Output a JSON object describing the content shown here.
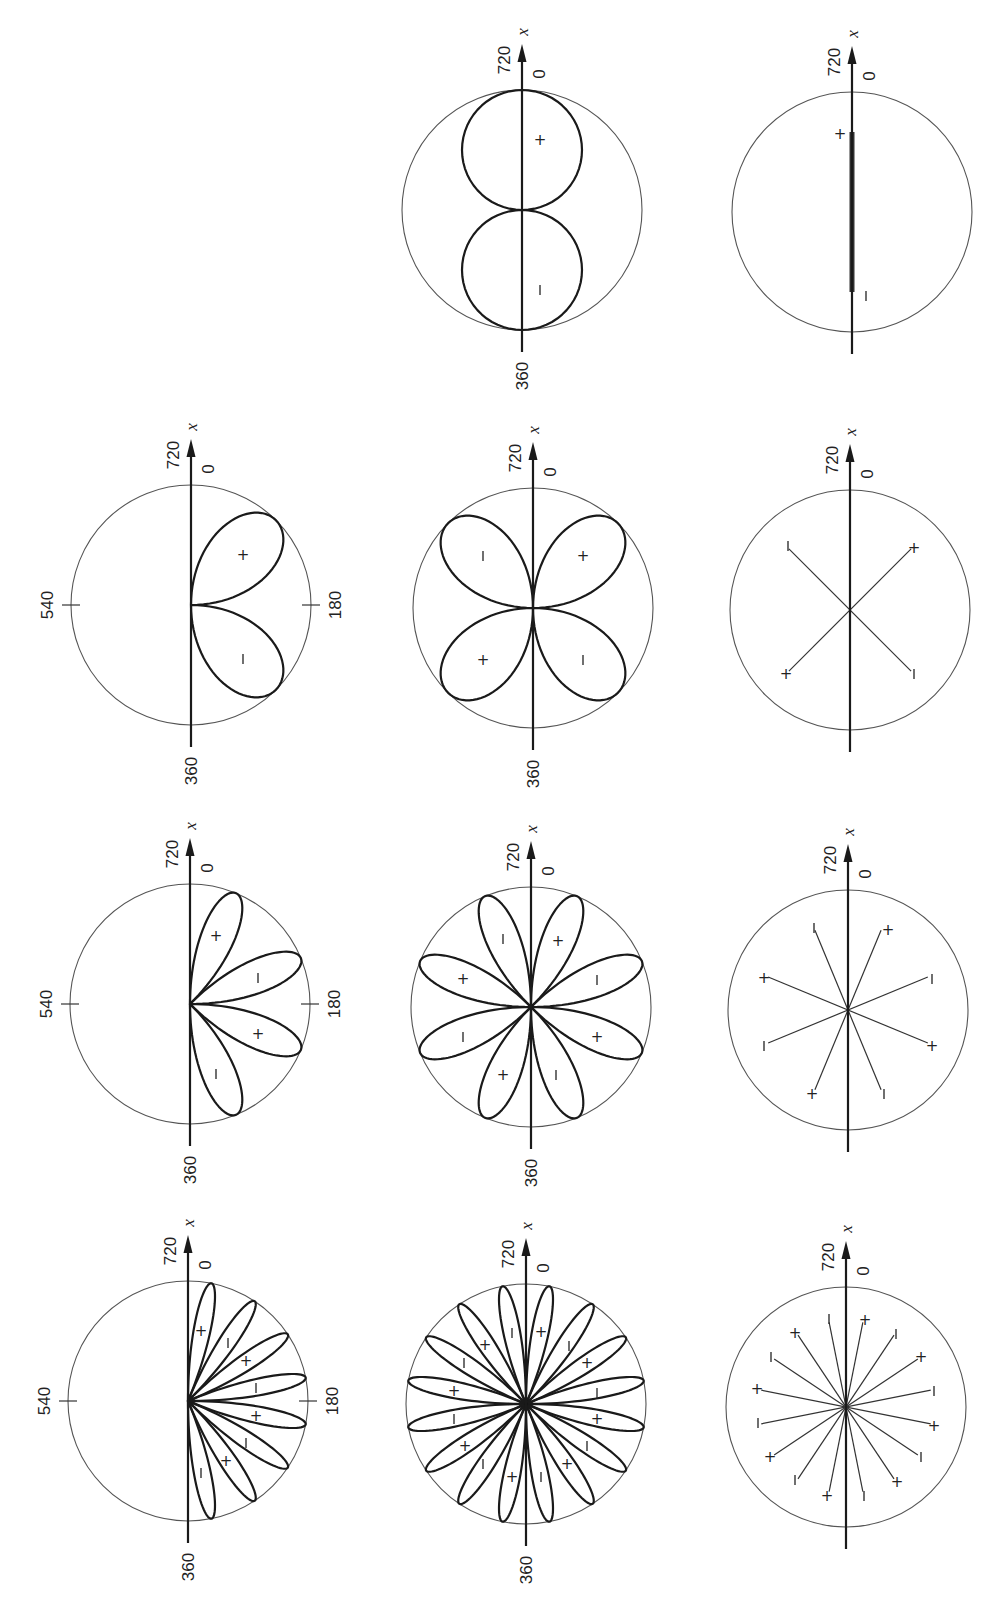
{
  "figure": {
    "colors": {
      "ink": "#1a1a1a",
      "circle": "#555555",
      "background": "#ffffff"
    },
    "axis_labels": {
      "variable": "x",
      "top_left": "720",
      "top_right": "0",
      "bottom": "360",
      "left_tick": "540",
      "right_tick": "180"
    },
    "radius": 120
  },
  "panels": [
    {
      "id": "r1-middle",
      "row": 1,
      "col": "middle",
      "cx": 522,
      "cy": 210,
      "kind": "rosette",
      "n": 1,
      "half": false,
      "show360": true,
      "showTicks": false,
      "signs": [
        {
          "dx": 18,
          "dy": -70,
          "s": "+"
        },
        {
          "dx": 18,
          "dy": 80,
          "s": "−"
        }
      ]
    },
    {
      "id": "r1-right",
      "row": 1,
      "col": "right",
      "cx": 852,
      "cy": 212,
      "kind": "segment",
      "show360": false,
      "showTicks": false,
      "segment": {
        "y1": -80,
        "y2": 80
      },
      "signs": [
        {
          "dx": -12,
          "dy": -78,
          "s": "+"
        },
        {
          "dx": 14,
          "dy": 84,
          "s": "−"
        }
      ]
    },
    {
      "id": "r2-left",
      "row": 2,
      "col": "left",
      "cx": 191,
      "cy": 605,
      "kind": "rosette",
      "n": 2,
      "half": true,
      "show360": true,
      "showTicks": true,
      "signs": [
        {
          "dx": 52,
          "dy": -50,
          "s": "+"
        },
        {
          "dx": 52,
          "dy": 54,
          "s": "−"
        }
      ]
    },
    {
      "id": "r2-middle",
      "row": 2,
      "col": "middle",
      "cx": 533,
      "cy": 608,
      "kind": "rosette",
      "n": 2,
      "half": false,
      "show360": true,
      "showTicks": true,
      "noTicks": true,
      "signs": [
        {
          "dx": -50,
          "dy": -52,
          "s": "−"
        },
        {
          "dx": 50,
          "dy": -52,
          "s": "+"
        },
        {
          "dx": -50,
          "dy": 52,
          "s": "+"
        },
        {
          "dx": 50,
          "dy": 52,
          "s": "−"
        }
      ]
    },
    {
      "id": "r2-right",
      "row": 2,
      "col": "right",
      "cx": 850,
      "cy": 610,
      "kind": "rays",
      "n": 2,
      "show360": false,
      "showTicks": false,
      "signs": [
        {
          "dx": -62,
          "dy": -64,
          "s": "−"
        },
        {
          "dx": 64,
          "dy": -62,
          "s": "+"
        },
        {
          "dx": -64,
          "dy": 64,
          "s": "+"
        },
        {
          "dx": 64,
          "dy": 64,
          "s": "−"
        }
      ]
    },
    {
      "id": "r3-left",
      "row": 3,
      "col": "left",
      "cx": 190,
      "cy": 1004,
      "kind": "rosette",
      "n": 4,
      "half": true,
      "show360": true,
      "showTicks": true,
      "signs": [
        {
          "dx": 26,
          "dy": -68,
          "s": "+"
        },
        {
          "dx": 68,
          "dy": -26,
          "s": "−"
        },
        {
          "dx": 68,
          "dy": 30,
          "s": "+"
        },
        {
          "dx": 26,
          "dy": 70,
          "s": "−"
        }
      ]
    },
    {
      "id": "r3-middle",
      "row": 3,
      "col": "middle",
      "cx": 531,
      "cy": 1007,
      "kind": "rosette",
      "n": 4,
      "half": false,
      "show360": true,
      "showTicks": false,
      "signs": [
        {
          "dx": 27,
          "dy": -66,
          "s": "+"
        },
        {
          "dx": 66,
          "dy": -27,
          "s": "−"
        },
        {
          "dx": 66,
          "dy": 30,
          "s": "+"
        },
        {
          "dx": 25,
          "dy": 68,
          "s": "−"
        },
        {
          "dx": -28,
          "dy": 68,
          "s": "+"
        },
        {
          "dx": -68,
          "dy": 30,
          "s": "−"
        },
        {
          "dx": -68,
          "dy": -28,
          "s": "+"
        },
        {
          "dx": -28,
          "dy": -68,
          "s": "−"
        }
      ]
    },
    {
      "id": "r3-right",
      "row": 3,
      "col": "right",
      "cx": 848,
      "cy": 1010,
      "kind": "rays",
      "n": 4,
      "show360": false,
      "showTicks": false,
      "signs": [
        {
          "dx": 40,
          "dy": -80,
          "s": "+"
        },
        {
          "dx": 84,
          "dy": -31,
          "s": "−"
        },
        {
          "dx": 84,
          "dy": 36,
          "s": "+"
        },
        {
          "dx": 36,
          "dy": 84,
          "s": "−"
        },
        {
          "dx": -36,
          "dy": 84,
          "s": "+"
        },
        {
          "dx": -84,
          "dy": 36,
          "s": "−"
        },
        {
          "dx": -84,
          "dy": -32,
          "s": "+"
        },
        {
          "dx": -34,
          "dy": -82,
          "s": "−"
        }
      ]
    },
    {
      "id": "r4-left",
      "row": 4,
      "col": "left",
      "cx": 188,
      "cy": 1401,
      "kind": "rosette",
      "n": 8,
      "half": true,
      "show360": true,
      "showTicks": true,
      "signs": [
        {
          "dx": 13,
          "dy": -70,
          "s": "+"
        },
        {
          "dx": 40,
          "dy": -58,
          "s": "−"
        },
        {
          "dx": 58,
          "dy": -40,
          "s": "+"
        },
        {
          "dx": 68,
          "dy": -13,
          "s": "−"
        },
        {
          "dx": 68,
          "dy": 15,
          "s": "+"
        },
        {
          "dx": 58,
          "dy": 42,
          "s": "−"
        },
        {
          "dx": 38,
          "dy": 60,
          "s": "+"
        },
        {
          "dx": 13,
          "dy": 72,
          "s": "−"
        }
      ]
    },
    {
      "id": "r4-middle",
      "row": 4,
      "col": "middle",
      "cx": 526,
      "cy": 1404,
      "kind": "rosette",
      "n": 8,
      "half": false,
      "show360": true,
      "showTicks": false,
      "signs": [
        {
          "dx": 15,
          "dy": -72,
          "s": "+"
        },
        {
          "dx": 43,
          "dy": -58,
          "s": "−"
        },
        {
          "dx": 61,
          "dy": -41,
          "s": "+"
        },
        {
          "dx": 71,
          "dy": -11,
          "s": "−"
        },
        {
          "dx": 71,
          "dy": 15,
          "s": "+"
        },
        {
          "dx": 61,
          "dy": 42,
          "s": "−"
        },
        {
          "dx": 41,
          "dy": 60,
          "s": "+"
        },
        {
          "dx": 15,
          "dy": 73,
          "s": "−"
        },
        {
          "dx": -14,
          "dy": 73,
          "s": "+"
        },
        {
          "dx": -43,
          "dy": 60,
          "s": "−"
        },
        {
          "dx": -61,
          "dy": 42,
          "s": "+"
        },
        {
          "dx": -72,
          "dy": 15,
          "s": "−"
        },
        {
          "dx": -72,
          "dy": -13,
          "s": "+"
        },
        {
          "dx": -62,
          "dy": -41,
          "s": "−"
        },
        {
          "dx": -41,
          "dy": -59,
          "s": "+"
        },
        {
          "dx": -14,
          "dy": -71,
          "s": "−"
        }
      ]
    },
    {
      "id": "r4-right",
      "row": 4,
      "col": "right",
      "cx": 846,
      "cy": 1407,
      "kind": "rays",
      "n": 8,
      "show360": false,
      "showTicks": false,
      "signs": [
        {
          "dx": 19,
          "dy": -87,
          "s": "+"
        },
        {
          "dx": 50,
          "dy": -73,
          "s": "−"
        },
        {
          "dx": 75,
          "dy": -50,
          "s": "+"
        },
        {
          "dx": 88,
          "dy": -16,
          "s": "−"
        },
        {
          "dx": 88,
          "dy": 19,
          "s": "+"
        },
        {
          "dx": 75,
          "dy": 50,
          "s": "−"
        },
        {
          "dx": 51,
          "dy": 75,
          "s": "+"
        },
        {
          "dx": 18,
          "dy": 89,
          "s": "−"
        },
        {
          "dx": -19,
          "dy": 89,
          "s": "+"
        },
        {
          "dx": -51,
          "dy": 73,
          "s": "−"
        },
        {
          "dx": -76,
          "dy": 50,
          "s": "+"
        },
        {
          "dx": -88,
          "dy": 16,
          "s": "−"
        },
        {
          "dx": -89,
          "dy": -18,
          "s": "+"
        },
        {
          "dx": -75,
          "dy": -50,
          "s": "−"
        },
        {
          "dx": -51,
          "dy": -74,
          "s": "+"
        },
        {
          "dx": -17,
          "dy": -88,
          "s": "−"
        }
      ]
    }
  ]
}
